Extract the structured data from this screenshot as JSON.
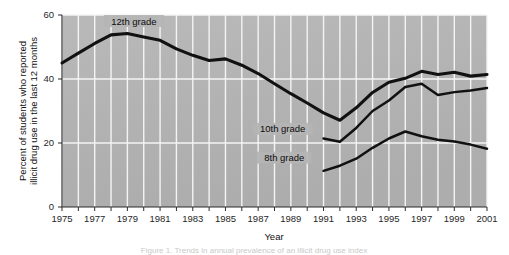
{
  "figure": {
    "background_color": "#ffffff",
    "plot_background_color": "#b4b4b4",
    "gridline_color": "#f4f4f4",
    "line_color": "#111111",
    "caption": "Figure 1. Trends in annual prevalence of an illicit drug use index"
  },
  "chart_data": {
    "type": "line",
    "title": "",
    "xlabel": "Year",
    "ylabel_line1": "Percent of students who reported",
    "ylabel_line2": "illicit drug use in the last 12 months",
    "ylim": [
      0,
      60
    ],
    "xlim": [
      1975,
      2001
    ],
    "yticks": [
      0,
      20,
      40,
      60
    ],
    "ytick_labels": [
      "0",
      "20",
      "40",
      "60"
    ],
    "xticks": [
      1975,
      1976,
      1977,
      1978,
      1979,
      1980,
      1981,
      1982,
      1983,
      1984,
      1985,
      1986,
      1987,
      1988,
      1989,
      1990,
      1991,
      1992,
      1993,
      1994,
      1995,
      1996,
      1997,
      1998,
      1999,
      2000,
      2001
    ],
    "xtick_labels": [
      "1975",
      "",
      "1977",
      "",
      "1979",
      "",
      "1981",
      "",
      "1983",
      "",
      "1985",
      "",
      "1987",
      "",
      "1989",
      "",
      "1991",
      "",
      "1993",
      "",
      "1995",
      "",
      "1997",
      "",
      "1999",
      "",
      "2001"
    ],
    "grid": true,
    "grid_axis": "both",
    "legend_position": "inline-annotations",
    "series": [
      {
        "name": "12th grade",
        "annotation_label": "12th grade",
        "x": [
          1975,
          1976,
          1977,
          1978,
          1979,
          1980,
          1981,
          1982,
          1983,
          1984,
          1985,
          1986,
          1987,
          1988,
          1989,
          1990,
          1991,
          1992,
          1993,
          1994,
          1995,
          1996,
          1997,
          1998,
          1999,
          2000,
          2001
        ],
        "values": [
          45.0,
          48.1,
          51.1,
          53.8,
          54.2,
          53.1,
          52.1,
          49.4,
          47.4,
          45.8,
          46.3,
          44.3,
          41.7,
          38.5,
          35.4,
          32.5,
          29.4,
          27.1,
          31.0,
          35.8,
          39.0,
          40.2,
          42.4,
          41.4,
          42.1,
          40.9,
          41.4
        ]
      },
      {
        "name": "10th grade",
        "annotation_label": "10th grade",
        "x": [
          1991,
          1992,
          1993,
          1994,
          1995,
          1996,
          1997,
          1998,
          1999,
          2000,
          2001
        ],
        "values": [
          21.4,
          20.4,
          24.7,
          30.0,
          33.3,
          37.5,
          38.5,
          35.0,
          35.9,
          36.4,
          37.2
        ]
      },
      {
        "name": "8th grade",
        "annotation_label": "8th grade",
        "x": [
          1991,
          1992,
          1993,
          1994,
          1995,
          1996,
          1997,
          1998,
          1999,
          2000,
          2001
        ],
        "values": [
          11.3,
          12.9,
          15.1,
          18.5,
          21.4,
          23.6,
          22.1,
          21.0,
          20.5,
          19.5,
          18.2
        ]
      }
    ]
  },
  "annotations": [
    {
      "id": "label-12th",
      "text": "12th grade",
      "x": 1979.4,
      "y": 57.5
    },
    {
      "id": "label-10th",
      "text": "10th grade",
      "x": 1988.5,
      "y": 23.8
    },
    {
      "id": "label-8th",
      "text": "8th grade",
      "x": 1988.6,
      "y": 14.8
    }
  ]
}
